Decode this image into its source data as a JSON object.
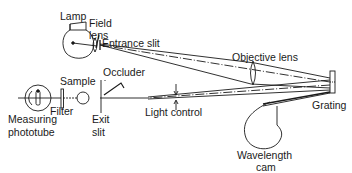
{
  "diagram": {
    "type": "optical-schematic",
    "labels": {
      "lamp": "Lamp",
      "field_lens_1": "Field",
      "field_lens_2": "lens",
      "entrance_slit": "Entrance slit",
      "objective_lens": "Objective lens",
      "sample": "Sample",
      "occluder": "Occluder",
      "filter": "Filter",
      "measuring_phototube_1": "Measuring",
      "measuring_phototube_2": "phototube",
      "exit_slit_1": "Exit",
      "exit_slit_2": "slit",
      "light_control": "Light control",
      "grating": "Grating",
      "wavelength_cam_1": "Wavelength",
      "wavelength_cam_2": "cam"
    },
    "components": [
      {
        "id": "lamp",
        "label": "Lamp"
      },
      {
        "id": "field-lens",
        "label": "Field lens"
      },
      {
        "id": "entrance-slit",
        "label": "Entrance slit"
      },
      {
        "id": "objective-lens",
        "label": "Objective lens"
      },
      {
        "id": "grating",
        "label": "Grating"
      },
      {
        "id": "wavelength-cam",
        "label": "Wavelength cam"
      },
      {
        "id": "light-control",
        "label": "Light control"
      },
      {
        "id": "occluder",
        "label": "Occluder"
      },
      {
        "id": "exit-slit",
        "label": "Exit slit"
      },
      {
        "id": "sample",
        "label": "Sample"
      },
      {
        "id": "filter",
        "label": "Filter"
      },
      {
        "id": "measuring-phototube",
        "label": "Measuring phototube"
      }
    ],
    "edges": [
      {
        "from": "lamp",
        "to": "field-lens"
      },
      {
        "from": "field-lens",
        "to": "entrance-slit"
      },
      {
        "from": "entrance-slit",
        "to": "objective-lens"
      },
      {
        "from": "objective-lens",
        "to": "grating"
      },
      {
        "from": "grating",
        "to": "light-control"
      },
      {
        "from": "light-control",
        "to": "exit-slit"
      },
      {
        "from": "exit-slit",
        "to": "sample"
      },
      {
        "from": "sample",
        "to": "filter"
      },
      {
        "from": "filter",
        "to": "measuring-phototube"
      },
      {
        "from": "wavelength-cam",
        "to": "grating"
      }
    ],
    "colors": {
      "ink": "#1a1a1a",
      "background": "#ffffff"
    }
  }
}
